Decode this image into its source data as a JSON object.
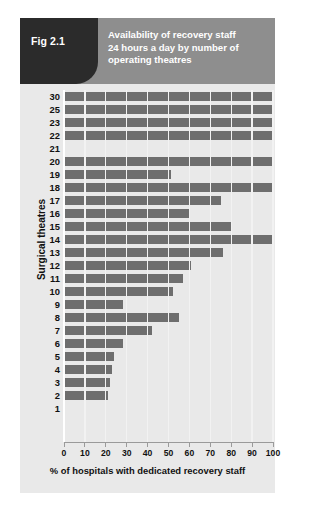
{
  "figure": {
    "tag": "Fig 2.1",
    "title_lines": [
      "Availability of recovery staff",
      "24 hours a day by number of",
      "operating theatres"
    ],
    "colors": {
      "tag_background": "#2b2b2b",
      "header_background": "#8e8e8e",
      "panel_background": "#e9e9e9",
      "bar": "#6e6e6e",
      "gridline": "#f2f2f2"
    }
  },
  "chart_data": {
    "type": "bar",
    "orientation": "horizontal",
    "title": "Availability of recovery staff 24 hours a day by number of operating theatres",
    "xlabel": "% of hospitals with dedicated recovery staff",
    "ylabel": "Surgical theatres",
    "xlim": [
      0,
      100
    ],
    "xticks": [
      0,
      10,
      20,
      30,
      40,
      50,
      60,
      70,
      80,
      90,
      100
    ],
    "xtick_labels": [
      "0",
      "10",
      "20",
      "30",
      "40",
      "50",
      "60",
      "70",
      "80",
      "90",
      "100"
    ],
    "grid": true,
    "legend": false,
    "categories": [
      "30",
      "25",
      "23",
      "22",
      "21",
      "20",
      "19",
      "18",
      "17",
      "16",
      "15",
      "14",
      "13",
      "12",
      "11",
      "10",
      "9",
      "8",
      "7",
      "6",
      "5",
      "4",
      "3",
      "2",
      "1"
    ],
    "values": [
      100,
      100,
      100,
      100,
      0,
      100,
      51,
      100,
      75,
      60,
      80,
      100,
      76,
      61,
      57,
      52,
      28,
      55,
      42,
      28,
      24,
      23,
      22,
      21,
      0
    ],
    "rows": [
      {
        "label": "30",
        "value": 100
      },
      {
        "label": "25",
        "value": 100
      },
      {
        "label": "23",
        "value": 100
      },
      {
        "label": "22",
        "value": 100
      },
      {
        "label": "21",
        "value": 0
      },
      {
        "label": "20",
        "value": 100
      },
      {
        "label": "19",
        "value": 51
      },
      {
        "label": "18",
        "value": 100
      },
      {
        "label": "17",
        "value": 75
      },
      {
        "label": "16",
        "value": 60
      },
      {
        "label": "15",
        "value": 80
      },
      {
        "label": "14",
        "value": 100
      },
      {
        "label": "13",
        "value": 76
      },
      {
        "label": "12",
        "value": 61
      },
      {
        "label": "11",
        "value": 57
      },
      {
        "label": "10",
        "value": 52
      },
      {
        "label": "9",
        "value": 28
      },
      {
        "label": "8",
        "value": 55
      },
      {
        "label": "7",
        "value": 42
      },
      {
        "label": "6",
        "value": 28
      },
      {
        "label": "5",
        "value": 24
      },
      {
        "label": "4",
        "value": 23
      },
      {
        "label": "3",
        "value": 22
      },
      {
        "label": "2",
        "value": 21
      },
      {
        "label": "1",
        "value": 0
      }
    ]
  }
}
